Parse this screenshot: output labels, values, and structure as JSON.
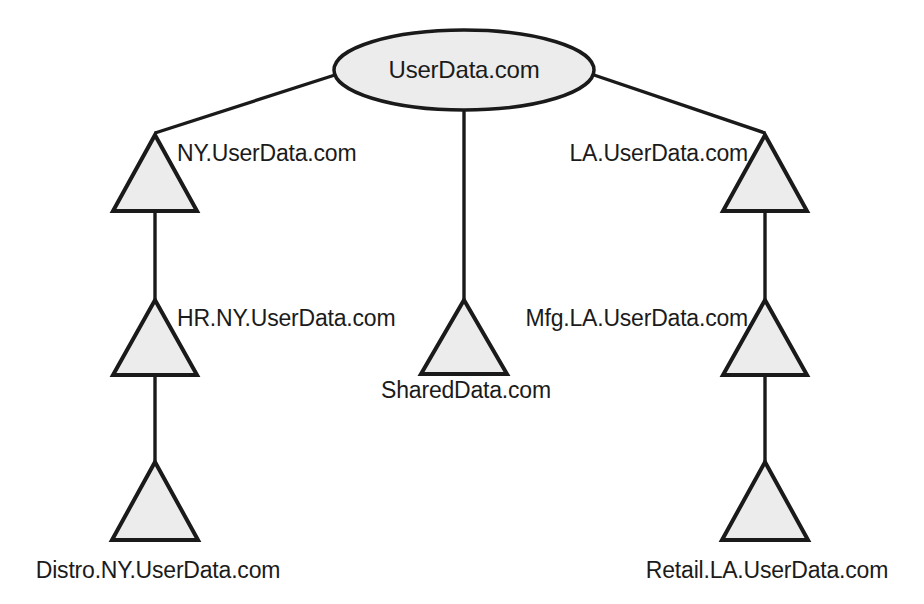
{
  "diagram": {
    "type": "dns-zone-delegation-tree",
    "colors": {
      "shape_fill": "#ececec",
      "shape_stroke": "#1a1a1a",
      "line": "#1a1a1a",
      "text": "#1b1b1b",
      "background": "#ffffff"
    },
    "root": {
      "id": "root-zone",
      "label": "UserData.com",
      "shape": "ellipse",
      "cx": 464,
      "cy": 70,
      "rx": 130,
      "ry": 40
    },
    "nodes": [
      {
        "id": "ny",
        "label": "NY.UserData.com",
        "shape": "triangle",
        "apex_x": 155,
        "apex_y": 135,
        "base_y": 211,
        "half_width": 42,
        "label_x": 177,
        "label_y": 161,
        "label_anchor": "start"
      },
      {
        "id": "hr-ny",
        "label": "HR.NY.UserData.com",
        "shape": "triangle",
        "apex_x": 155,
        "apex_y": 300,
        "base_y": 375,
        "half_width": 42,
        "label_x": 177,
        "label_y": 326,
        "label_anchor": "start"
      },
      {
        "id": "distro-ny",
        "label": "Distro.NY.UserData.com",
        "shape": "triangle",
        "apex_x": 155,
        "apex_y": 462,
        "base_y": 540,
        "half_width": 43,
        "label_x": 158,
        "label_y": 578,
        "label_anchor": "middle"
      },
      {
        "id": "shared",
        "label": "SharedData.com",
        "shape": "triangle",
        "apex_x": 464,
        "apex_y": 300,
        "base_y": 374,
        "half_width": 43,
        "label_x": 466,
        "label_y": 398,
        "label_anchor": "middle"
      },
      {
        "id": "la",
        "label": "LA.UserData.com",
        "shape": "triangle",
        "apex_x": 765,
        "apex_y": 135,
        "base_y": 211,
        "half_width": 42,
        "label_x": 748,
        "label_y": 161,
        "label_anchor": "end"
      },
      {
        "id": "mfg-la",
        "label": "Mfg.LA.UserData.com",
        "shape": "triangle",
        "apex_x": 765,
        "apex_y": 300,
        "base_y": 375,
        "half_width": 42,
        "label_x": 748,
        "label_y": 326,
        "label_anchor": "end"
      },
      {
        "id": "retail-la",
        "label": "Retail.LA.UserData.com",
        "shape": "triangle",
        "apex_x": 765,
        "apex_y": 462,
        "base_y": 540,
        "half_width": 43,
        "label_x": 767,
        "label_y": 578,
        "label_anchor": "middle"
      }
    ],
    "edges": [
      {
        "id": "root-to-ny",
        "from": "root-zone",
        "to": "ny",
        "x1": 338,
        "y1": 74,
        "x2": 155,
        "y2": 133
      },
      {
        "id": "root-to-shared",
        "from": "root-zone",
        "to": "shared",
        "x1": 464,
        "y1": 110,
        "x2": 464,
        "y2": 299
      },
      {
        "id": "root-to-la",
        "from": "root-zone",
        "to": "la",
        "x1": 591,
        "y1": 74,
        "x2": 765,
        "y2": 133
      },
      {
        "id": "ny-to-hr",
        "from": "ny",
        "to": "hr-ny",
        "x1": 155,
        "y1": 211,
        "x2": 155,
        "y2": 300
      },
      {
        "id": "hr-to-distro",
        "from": "hr-ny",
        "to": "distro-ny",
        "x1": 155,
        "y1": 375,
        "x2": 155,
        "y2": 462
      },
      {
        "id": "la-to-mfg",
        "from": "la",
        "to": "mfg-la",
        "x1": 765,
        "y1": 211,
        "x2": 765,
        "y2": 300
      },
      {
        "id": "mfg-to-retail",
        "from": "mfg-la",
        "to": "retail-la",
        "x1": 765,
        "y1": 375,
        "x2": 765,
        "y2": 462
      }
    ]
  }
}
